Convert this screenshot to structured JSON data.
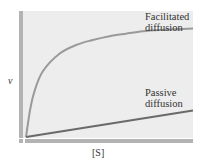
{
  "chart_data": {
    "type": "line",
    "title": "",
    "xlabel": "[S]",
    "ylabel": "v",
    "grid": false,
    "legend": "inline labels",
    "xlim": [
      0,
      10
    ],
    "ylim": [
      0,
      1
    ],
    "series": [
      {
        "name": "Facilitated diffusion",
        "label_line1": "Facilitated",
        "label_line2": "diffusion",
        "color": "#9a9a9a",
        "x": [
          0,
          0.25,
          0.5,
          1,
          2,
          3,
          4,
          5,
          6,
          7,
          8,
          9,
          10
        ],
        "values": [
          0,
          0.22,
          0.36,
          0.52,
          0.66,
          0.73,
          0.77,
          0.8,
          0.82,
          0.84,
          0.85,
          0.855,
          0.86
        ]
      },
      {
        "name": "Passive diffusion",
        "label_line1": "Passive",
        "label_line2": "diffusion",
        "color": "#6a6a6a",
        "x": [
          0,
          10
        ],
        "values": [
          0,
          0.21
        ]
      }
    ]
  },
  "colors": {
    "plot_bg": "#ededed",
    "axis_bar": "#b3b3b3"
  }
}
